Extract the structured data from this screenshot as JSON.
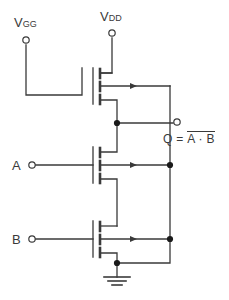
{
  "diagram": {
    "type": "nmos-nand-gate-schematic",
    "background_color": "#ffffff",
    "wire_color": "#3a3a3a",
    "text_color": "#3a3a3a"
  },
  "labels": {
    "vgg": {
      "base": "V",
      "sub": "GG"
    },
    "vdd": {
      "base": "V",
      "sub": "DD"
    },
    "input_a": "A",
    "input_b": "B",
    "output_prefix": "Q = ",
    "output_expr": "A · B",
    "output_full": "Q = A · B (complemented)"
  },
  "terminals": [
    {
      "name": "vgg-terminal",
      "x": 26,
      "y": 40
    },
    {
      "name": "vdd-terminal",
      "x": 112,
      "y": 33
    },
    {
      "name": "input-a-terminal",
      "x": 32,
      "y": 165
    },
    {
      "name": "input-b-terminal",
      "x": 32,
      "y": 239
    },
    {
      "name": "output-terminal",
      "x": 177,
      "y": 122
    }
  ],
  "transistors": [
    {
      "name": "load-transistor",
      "gate_label": "V_GG",
      "gate_y": 86
    },
    {
      "name": "transistor-a",
      "gate_label": "A",
      "gate_y": 165
    },
    {
      "name": "transistor-b",
      "gate_label": "B",
      "gate_y": 239
    }
  ],
  "nodes": [
    {
      "name": "output-node",
      "x": 117,
      "y": 123
    },
    {
      "name": "body-node-a",
      "x": 170,
      "y": 165
    },
    {
      "name": "body-node-b",
      "x": 170,
      "y": 239
    },
    {
      "name": "ground-node",
      "x": 117,
      "y": 263
    }
  ],
  "ground": {
    "name": "ground-symbol",
    "x": 117,
    "y": 277
  }
}
